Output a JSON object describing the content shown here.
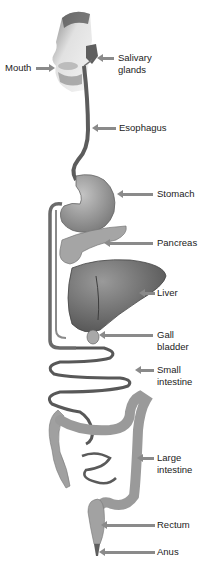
{
  "diagram": {
    "colors": {
      "organ": "#9a9a9a",
      "organ_dark": "#6e6e6e",
      "tube": "#7c7c7c",
      "arrow": "#8a8a8a",
      "text": "#222222"
    },
    "labels": [
      {
        "id": "mouth",
        "text": "Mouth"
      },
      {
        "id": "salivary-glands",
        "text": "Salivary\nglands"
      },
      {
        "id": "esophagus",
        "text": "Esophagus"
      },
      {
        "id": "stomach",
        "text": "Stomach"
      },
      {
        "id": "pancreas",
        "text": "Pancreas"
      },
      {
        "id": "liver",
        "text": "Liver"
      },
      {
        "id": "gall-bladder",
        "text": "Gall\nbladder"
      },
      {
        "id": "small-intestine",
        "text": "Small\nintestine"
      },
      {
        "id": "large-intestine",
        "text": "Large\nintestine"
      },
      {
        "id": "rectum",
        "text": "Rectum"
      },
      {
        "id": "anus",
        "text": "Anus"
      }
    ]
  }
}
